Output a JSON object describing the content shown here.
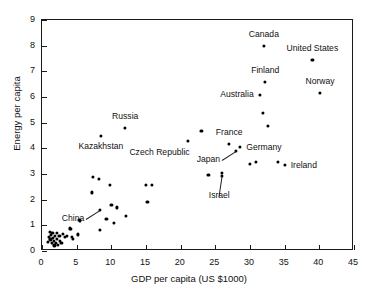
{
  "chart_data": {
    "type": "scatter",
    "title": "",
    "xlabel": "GDP per capita (US $1000)",
    "ylabel": "Energy per capita",
    "xlim": [
      0,
      45
    ],
    "ylim": [
      0,
      9
    ],
    "xticks": [
      0,
      5,
      10,
      15,
      20,
      25,
      30,
      35,
      40,
      45
    ],
    "yticks": [
      0,
      1,
      2,
      3,
      4,
      5,
      6,
      7,
      8,
      9
    ],
    "grid": false,
    "legend": "none",
    "marker_color": "#000000",
    "axis_color": "#1a1a1a",
    "points": [
      {
        "x": 0.8,
        "y": 0.35,
        "label": ""
      },
      {
        "x": 1.0,
        "y": 0.55,
        "label": ""
      },
      {
        "x": 1.1,
        "y": 0.75,
        "label": ""
      },
      {
        "x": 1.2,
        "y": 0.45,
        "label": ""
      },
      {
        "x": 1.3,
        "y": 0.62,
        "label": ""
      },
      {
        "x": 1.4,
        "y": 0.3,
        "label": ""
      },
      {
        "x": 1.5,
        "y": 0.72,
        "label": ""
      },
      {
        "x": 1.6,
        "y": 0.5,
        "label": ""
      },
      {
        "x": 1.7,
        "y": 0.4,
        "label": ""
      },
      {
        "x": 1.8,
        "y": 0.22,
        "label": ""
      },
      {
        "x": 1.9,
        "y": 0.6,
        "label": ""
      },
      {
        "x": 2.0,
        "y": 0.33,
        "label": ""
      },
      {
        "x": 2.1,
        "y": 0.7,
        "label": ""
      },
      {
        "x": 2.2,
        "y": 0.48,
        "label": ""
      },
      {
        "x": 2.3,
        "y": 0.25,
        "label": ""
      },
      {
        "x": 2.5,
        "y": 0.58,
        "label": ""
      },
      {
        "x": 2.6,
        "y": 0.38,
        "label": ""
      },
      {
        "x": 2.8,
        "y": 0.3,
        "label": ""
      },
      {
        "x": 3.0,
        "y": 0.68,
        "label": ""
      },
      {
        "x": 3.3,
        "y": 0.55,
        "label": ""
      },
      {
        "x": 3.6,
        "y": 0.6,
        "label": ""
      },
      {
        "x": 4.0,
        "y": 0.88,
        "label": ""
      },
      {
        "x": 4.2,
        "y": 0.85,
        "label": ""
      },
      {
        "x": 4.3,
        "y": 0.55,
        "label": ""
      },
      {
        "x": 4.5,
        "y": 0.48,
        "label": ""
      },
      {
        "x": 5.2,
        "y": 0.65,
        "label": ""
      },
      {
        "x": 5.4,
        "y": 1.22,
        "label": ""
      },
      {
        "x": 5.5,
        "y": 1.18,
        "label": ""
      },
      {
        "x": 7.2,
        "y": 2.28,
        "label": ""
      },
      {
        "x": 7.4,
        "y": 2.9,
        "label": ""
      },
      {
        "x": 8.2,
        "y": 2.8,
        "label": ""
      },
      {
        "x": 8.3,
        "y": 0.82,
        "label": ""
      },
      {
        "x": 8.4,
        "y": 1.6,
        "label": "China"
      },
      {
        "x": 8.5,
        "y": 4.5,
        "label": "Kazakhstan"
      },
      {
        "x": 9.3,
        "y": 1.25,
        "label": ""
      },
      {
        "x": 9.8,
        "y": 2.58,
        "label": ""
      },
      {
        "x": 10.0,
        "y": 1.8,
        "label": ""
      },
      {
        "x": 10.4,
        "y": 1.1,
        "label": ""
      },
      {
        "x": 10.8,
        "y": 1.7,
        "label": ""
      },
      {
        "x": 12.0,
        "y": 4.8,
        "label": "Russia"
      },
      {
        "x": 12.1,
        "y": 1.38,
        "label": ""
      },
      {
        "x": 15.0,
        "y": 2.58,
        "label": ""
      },
      {
        "x": 15.2,
        "y": 1.9,
        "label": ""
      },
      {
        "x": 15.9,
        "y": 2.58,
        "label": ""
      },
      {
        "x": 21.0,
        "y": 4.3,
        "label": "Czech Republic"
      },
      {
        "x": 23.0,
        "y": 4.68,
        "label": ""
      },
      {
        "x": 24.0,
        "y": 2.98,
        "label": ""
      },
      {
        "x": 26.0,
        "y": 2.92,
        "label": "Israel"
      },
      {
        "x": 26.0,
        "y": 3.05,
        "label": ""
      },
      {
        "x": 27.0,
        "y": 4.18,
        "label": "France"
      },
      {
        "x": 28.0,
        "y": 3.9,
        "label": "Japan"
      },
      {
        "x": 28.6,
        "y": 4.05,
        "label": "Germany"
      },
      {
        "x": 30.0,
        "y": 3.38,
        "label": ""
      },
      {
        "x": 30.9,
        "y": 3.48,
        "label": ""
      },
      {
        "x": 31.4,
        "y": 6.08,
        "label": "Australia"
      },
      {
        "x": 31.9,
        "y": 5.38,
        "label": ""
      },
      {
        "x": 32.0,
        "y": 7.98,
        "label": "Canada"
      },
      {
        "x": 32.2,
        "y": 6.58,
        "label": "Finland"
      },
      {
        "x": 32.6,
        "y": 4.88,
        "label": ""
      },
      {
        "x": 34.0,
        "y": 3.48,
        "label": ""
      },
      {
        "x": 35.0,
        "y": 3.35,
        "label": "Ireland"
      },
      {
        "x": 39.0,
        "y": 7.45,
        "label": "United States"
      },
      {
        "x": 40.1,
        "y": 6.15,
        "label": "Norway"
      }
    ],
    "annotations": [
      {
        "text": "Canada",
        "x": 32.0,
        "y": 7.98,
        "placement": "above"
      },
      {
        "text": "United States",
        "x": 39.0,
        "y": 7.45,
        "placement": "above"
      },
      {
        "text": "Finland",
        "x": 32.2,
        "y": 6.58,
        "placement": "above"
      },
      {
        "text": "Norway",
        "x": 40.1,
        "y": 6.15,
        "placement": "above"
      },
      {
        "text": "Australia",
        "x": 31.4,
        "y": 6.08,
        "placement": "left"
      },
      {
        "text": "Russia",
        "x": 12.0,
        "y": 4.8,
        "placement": "above"
      },
      {
        "text": "Kazakhstan",
        "x": 8.5,
        "y": 4.5,
        "placement": "below"
      },
      {
        "text": "Czech Republic",
        "x": 21.0,
        "y": 4.3,
        "placement": "below-left"
      },
      {
        "text": "France",
        "x": 27.0,
        "y": 4.18,
        "placement": "above"
      },
      {
        "text": "Germany",
        "x": 28.6,
        "y": 4.05,
        "placement": "right"
      },
      {
        "text": "Japan",
        "x": 28.0,
        "y": 3.9,
        "placement": "leader-left"
      },
      {
        "text": "Ireland",
        "x": 35.0,
        "y": 3.35,
        "placement": "right"
      },
      {
        "text": "Israel",
        "x": 26.0,
        "y": 2.92,
        "placement": "leader-below"
      },
      {
        "text": "China",
        "x": 8.4,
        "y": 1.6,
        "placement": "leader-left"
      }
    ]
  },
  "axes": {
    "xlabel": "GDP per capita (US $1000)",
    "ylabel": "Energy per capita",
    "xticklabels": [
      "0",
      "5",
      "10",
      "15",
      "20",
      "25",
      "30",
      "35",
      "40",
      "45"
    ],
    "yticklabels": [
      "0",
      "1",
      "2",
      "3",
      "4",
      "5",
      "6",
      "7",
      "8",
      "9"
    ]
  }
}
